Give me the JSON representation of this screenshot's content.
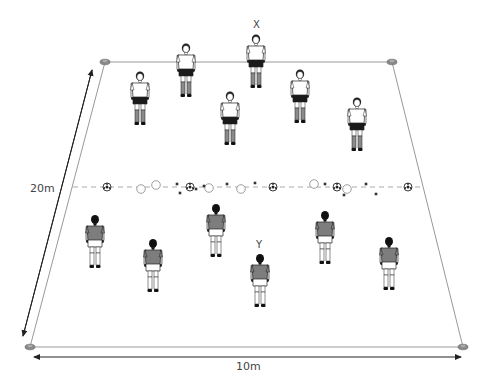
{
  "diagram": {
    "title": "",
    "field": {
      "corners": {
        "top_left": [
          105,
          62
        ],
        "top_right": [
          392,
          62
        ],
        "bottom_left": [
          30,
          347
        ],
        "bottom_right": [
          463,
          347
        ]
      },
      "line_color": "#999999",
      "cone_color": "#888888"
    },
    "center_line": {
      "y": 187,
      "x_start": 73,
      "x_end": 422,
      "style": "dashed",
      "color": "#aaaaaa"
    },
    "dimension_labels": {
      "width": "10m",
      "length": "20m"
    },
    "player_labels": {
      "x_label": "X",
      "y_label": "Y"
    },
    "balls": [
      {
        "x": 107,
        "y": 187
      },
      {
        "x": 190,
        "y": 187
      },
      {
        "x": 273,
        "y": 187
      },
      {
        "x": 337,
        "y": 187
      },
      {
        "x": 408,
        "y": 187
      }
    ],
    "hoops": [
      {
        "x": 141,
        "y": 189
      },
      {
        "x": 156,
        "y": 185
      },
      {
        "x": 209,
        "y": 188
      },
      {
        "x": 241,
        "y": 189
      },
      {
        "x": 314,
        "y": 184
      },
      {
        "x": 347,
        "y": 189
      }
    ],
    "markers": [
      {
        "x": 177,
        "y": 184
      },
      {
        "x": 180,
        "y": 193
      },
      {
        "x": 196,
        "y": 189
      },
      {
        "x": 204,
        "y": 186
      },
      {
        "x": 227,
        "y": 184
      },
      {
        "x": 255,
        "y": 183
      },
      {
        "x": 325,
        "y": 184
      },
      {
        "x": 344,
        "y": 195
      },
      {
        "x": 366,
        "y": 184
      },
      {
        "x": 376,
        "y": 194
      }
    ],
    "team_white": {
      "shirt_color": "#ffffff",
      "shorts_color": "#1a1a1a",
      "socks_color": "#8a8a8a",
      "players": [
        {
          "x": 186,
          "y": 44,
          "label": ""
        },
        {
          "x": 256,
          "y": 35,
          "label": "X"
        },
        {
          "x": 140,
          "y": 72,
          "label": ""
        },
        {
          "x": 300,
          "y": 70,
          "label": ""
        },
        {
          "x": 230,
          "y": 92,
          "label": ""
        },
        {
          "x": 357,
          "y": 98,
          "label": ""
        }
      ]
    },
    "team_grey": {
      "shirt_color": "#7d7d7d",
      "shorts_color": "#ffffff",
      "socks_color": "#ffffff",
      "players": [
        {
          "x": 95,
          "y": 215,
          "label": ""
        },
        {
          "x": 153,
          "y": 239,
          "label": ""
        },
        {
          "x": 216,
          "y": 204,
          "label": ""
        },
        {
          "x": 325,
          "y": 211,
          "label": ""
        },
        {
          "x": 389,
          "y": 237,
          "label": ""
        },
        {
          "x": 260,
          "y": 254,
          "label": "Y"
        }
      ]
    }
  }
}
